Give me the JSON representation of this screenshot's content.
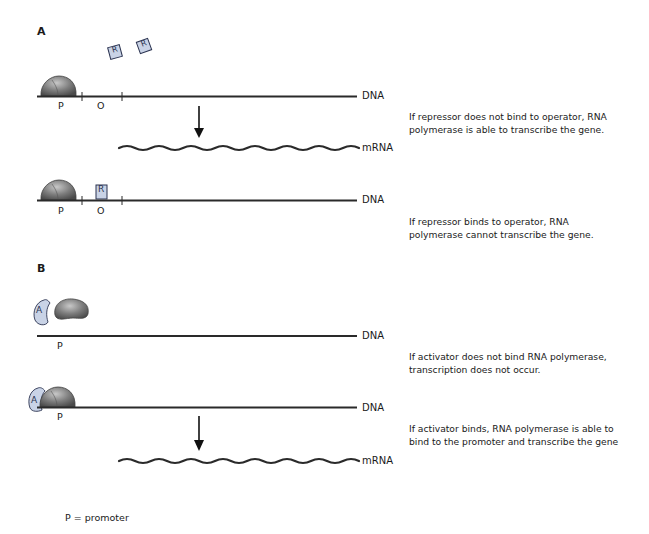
{
  "panel_a": {
    "label": "A",
    "scenario_1": {
      "dna_label": "DNA",
      "mrna_label": "mRNA",
      "promoter_label": "P",
      "operator_label": "O",
      "free_repressors": [
        "R",
        "R"
      ],
      "caption_line1": "If repressor does not bind to operator, RNA",
      "caption_line2": "polymerase is able to transcribe the gene."
    },
    "scenario_2": {
      "dna_label": "DNA",
      "promoter_label": "P",
      "operator_label": "O",
      "bound_repressor": "R",
      "caption_line1": "If repressor binds to operator, RNA",
      "caption_line2": "polymerase cannot transcribe the gene."
    }
  },
  "panel_b": {
    "label": "B",
    "scenario_1": {
      "dna_label": "DNA",
      "promoter_label": "P",
      "activator": "A",
      "caption_line1": "If activator does not bind RNA polymerase,",
      "caption_line2": "transcription does not occur."
    },
    "scenario_2": {
      "dna_label": "DNA",
      "mrna_label": "mRNA",
      "promoter_label": "P",
      "activator": "A",
      "caption_line1": "If activator binds, RNA polymerase is able to",
      "caption_line2": "bind to the promoter and transcribe the gene"
    }
  },
  "legend": {
    "text": "P = promoter"
  },
  "colors": {
    "line": "#2a2a2a",
    "polymerase": "#7a7a7a",
    "regulator_fill": "#c9d3e6",
    "regulator_stroke": "#2b3350"
  }
}
